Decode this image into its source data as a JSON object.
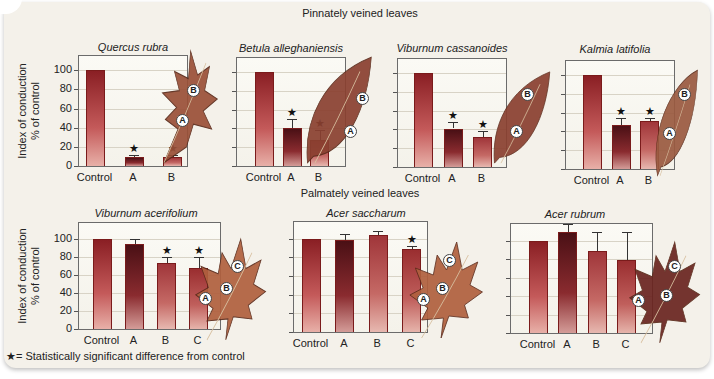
{
  "figure": {
    "group_pinnate_title": "Pinnately veined leaves",
    "group_palmate_title": "Palmately veined leaves",
    "ylabel_line1": "Index of conduction",
    "ylabel_line2": "% of control",
    "footnote": "★= Statistically significant difference from control",
    "colors": {
      "background": "#f4f1ea",
      "bar_control": "#8a1f24",
      "bar_A": "#4a1015",
      "bar_B": "#a0363a",
      "leaf_red": "#a84a3c"
    }
  },
  "chart_data": [
    {
      "type": "bar",
      "title": "Quercus rubra",
      "group": "Pinnately veined leaves",
      "categories": [
        "Control",
        "A",
        "B"
      ],
      "values": [
        100,
        9,
        9
      ],
      "error_upper": [
        100,
        12,
        12
      ],
      "significant": [
        false,
        true,
        true
      ],
      "ylabel": "Index of conduction % of control",
      "yticks": [
        0,
        20,
        40,
        60,
        80,
        100
      ],
      "ylim": [
        0,
        115
      ],
      "grid": true,
      "leaf_markers": [
        "A",
        "B"
      ]
    },
    {
      "type": "bar",
      "title": "Betula alleghaniensis",
      "group": "Pinnately veined leaves",
      "categories": [
        "Control",
        "A",
        "B"
      ],
      "values": [
        100,
        40,
        28
      ],
      "error_upper": [
        100,
        50,
        38
      ],
      "significant": [
        false,
        true,
        true
      ],
      "ylim": [
        0,
        115
      ],
      "grid": true,
      "leaf_markers": [
        "A",
        "B"
      ]
    },
    {
      "type": "bar",
      "title": "Viburnum cassanoides",
      "group": "Pinnately veined leaves",
      "categories": [
        "Control",
        "A",
        "B"
      ],
      "values": [
        100,
        41,
        32
      ],
      "error_upper": [
        100,
        48,
        38
      ],
      "significant": [
        false,
        true,
        true
      ],
      "ylim": [
        0,
        115
      ],
      "grid": true,
      "leaf_markers": [
        "A",
        "B"
      ]
    },
    {
      "type": "bar",
      "title": "Kalmia latifolia",
      "group": "Pinnately veined leaves",
      "categories": [
        "Control",
        "A",
        "B"
      ],
      "values": [
        100,
        47,
        51
      ],
      "error_upper": [
        100,
        54,
        54
      ],
      "significant": [
        false,
        true,
        true
      ],
      "ylim": [
        0,
        115
      ],
      "grid": true,
      "leaf_markers": [
        "A",
        "B"
      ]
    },
    {
      "type": "bar",
      "title": "Viburnum acerifolium",
      "group": "Palmately veined leaves",
      "categories": [
        "Control",
        "A",
        "B",
        "C"
      ],
      "values": [
        100,
        95,
        74,
        68
      ],
      "error_upper": [
        100,
        100,
        80,
        80
      ],
      "significant": [
        false,
        false,
        true,
        true
      ],
      "ylabel": "Index of conduction % of control",
      "yticks": [
        0,
        20,
        40,
        60,
        80,
        100
      ],
      "ylim": [
        0,
        118
      ],
      "grid": true,
      "leaf_markers": [
        "A",
        "B",
        "C"
      ]
    },
    {
      "type": "bar",
      "title": "Acer saccharum",
      "group": "Palmately veined leaves",
      "categories": [
        "Control",
        "A",
        "B",
        "C"
      ],
      "values": [
        100,
        99,
        104,
        89
      ],
      "error_upper": [
        100,
        105,
        108,
        92
      ],
      "significant": [
        false,
        false,
        false,
        true
      ],
      "ylim": [
        0,
        118
      ],
      "grid": true,
      "leaf_markers": [
        "A",
        "B",
        "C"
      ]
    },
    {
      "type": "bar",
      "title": "Acer rubrum",
      "group": "Palmately veined leaves",
      "categories": [
        "Control",
        "A",
        "B",
        "C"
      ],
      "values": [
        100,
        109,
        89,
        79
      ],
      "error_upper": [
        100,
        118,
        109,
        109
      ],
      "significant": [
        false,
        false,
        false,
        false
      ],
      "ylim": [
        0,
        118
      ],
      "grid": true,
      "leaf_markers": [
        "A",
        "B",
        "C"
      ]
    }
  ]
}
